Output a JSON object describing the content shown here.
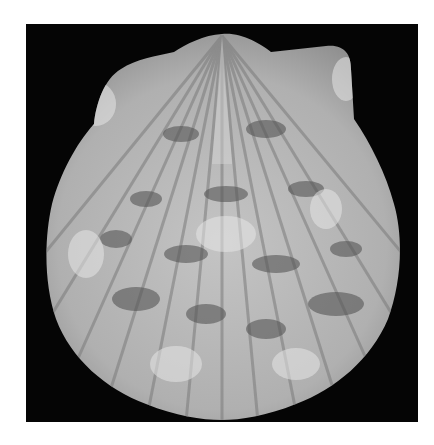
{
  "image": {
    "subject": "scallop shell",
    "description": "Grayscale photograph of a scallop shell on a black background",
    "background_color": "#050505",
    "page_background": "#ffffff",
    "shell_light": "#d9d9d9",
    "shell_mid": "#a8a8a8",
    "shell_dark": "#5a5a5a"
  }
}
